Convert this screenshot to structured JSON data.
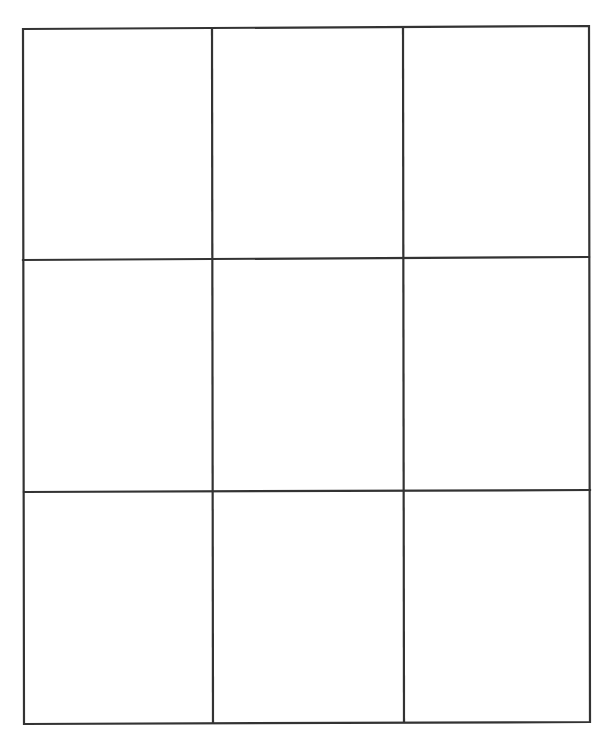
{
  "grid": {
    "rows": 3,
    "columns": 3,
    "line_color": "#333333",
    "background_color": "#ffffff",
    "cells": [
      [
        "",
        "",
        ""
      ],
      [
        "",
        "",
        ""
      ],
      [
        "",
        "",
        ""
      ]
    ]
  }
}
